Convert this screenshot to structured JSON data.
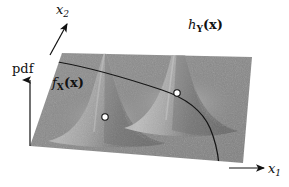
{
  "figure": {
    "title": "",
    "type": "3d-surface-illustration",
    "background_color": "#ffffff",
    "plane_color": "#8a8a8a",
    "ink_color": "#111111",
    "marker_fill": "#ffffff",
    "marker_stroke": "#111111"
  },
  "axes": {
    "vertical": {
      "label": "pdf",
      "name": "pdf-axis",
      "direction": "up"
    },
    "depth": {
      "label_base": "x",
      "label_sub": "2",
      "name": "x2-axis",
      "direction": "up-right"
    },
    "horizontal": {
      "label_base": "x",
      "label_sub": "1",
      "name": "x1-axis",
      "direction": "right"
    }
  },
  "surfaces": [
    {
      "id": "left-peak",
      "label_base": "f",
      "label_sub": "X",
      "label_arg": "(x)",
      "description": "lower density peak on the left",
      "apex": {
        "x": 105,
        "y": 50
      },
      "relative_height": 0.55
    },
    {
      "id": "right-peak",
      "label_base": "h",
      "label_sub": "Y",
      "label_arg": "(x)",
      "description": "taller density peak on the right",
      "apex": {
        "x": 178,
        "y": 28
      },
      "relative_height": 1.0
    }
  ],
  "markers": [
    {
      "id": "marker-left",
      "x": 105,
      "y": 117,
      "on_curve": false
    },
    {
      "id": "marker-right",
      "x": 177,
      "y": 93,
      "on_curve": true
    }
  ],
  "curve": {
    "id": "trajectory-curve",
    "description": "dark curve across the plane descending to the lower right",
    "stroke": "#111111"
  }
}
